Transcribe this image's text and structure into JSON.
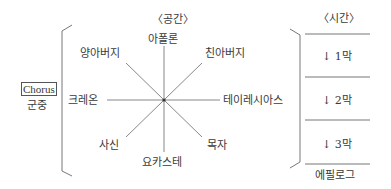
{
  "space": {
    "title": "〈공간〉",
    "nodes": {
      "top": "아폴론",
      "top_left": "양아버지",
      "top_right": "친아버지",
      "left": "크레온",
      "right": "테이레시아스",
      "bottom_left": "사신",
      "bottom_right": "목자",
      "bottom": "요카스테"
    }
  },
  "chorus": {
    "label": "Chorus",
    "sublabel": "군중"
  },
  "time": {
    "title": "〈시간〉",
    "acts": [
      "↓ 1막",
      "↓ 2막",
      "↓ 3막"
    ],
    "epilogue": "에필로그"
  }
}
